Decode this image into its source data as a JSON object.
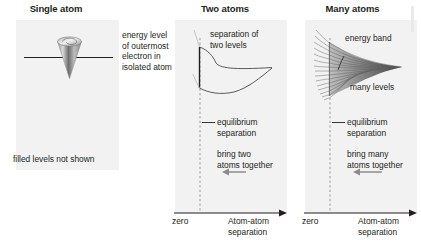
{
  "figure": {
    "caption": "Formation of energy bands as atoms are brought together",
    "background_color": "#ffffff",
    "panel_background_color": "#f2f2f2",
    "line_color": "#231f20",
    "text_color": "#231f20"
  },
  "panels": [
    {
      "id": "single-atom",
      "title": "Single atom",
      "annotations": {
        "energy_level": "energy level\nof outermost\nelectron in\nisolated atom",
        "filled_levels": "filled levels not shown"
      }
    },
    {
      "id": "two-atoms",
      "title": "Two atoms",
      "annotations": {
        "separation_of_levels": "separation of\ntwo levels",
        "equilibrium": "equilibrium\nseparation",
        "bring_together": "bring two\natoms together"
      },
      "axis": {
        "origin_label": "zero",
        "x_label": "Atom-atom\nseparation",
        "arrow_direction": "left"
      }
    },
    {
      "id": "many-atoms",
      "title": "Many atoms",
      "annotations": {
        "energy_band": "energy band",
        "many_levels": "many levels",
        "equilibrium": "equilibrium\nseparation",
        "bring_together": "bring many\natoms together"
      },
      "axis": {
        "origin_label": "zero",
        "x_label": "Atom-atom\nseparation",
        "arrow_direction": "left"
      }
    }
  ]
}
